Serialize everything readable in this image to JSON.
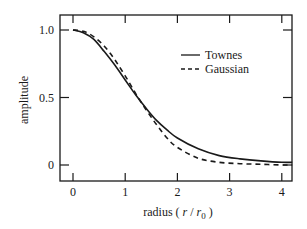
{
  "chart_data": {
    "type": "line",
    "title": "",
    "xlabel": "radius ( r / r0 )",
    "xlabel_parts": {
      "prefix": "radius ( ",
      "r": "r",
      "slash": " / ",
      "r0": "r",
      "sub": "0",
      "suffix": " )"
    },
    "ylabel": "amplitude",
    "xlim": [
      -0.3,
      4.2
    ],
    "ylim": [
      -0.08,
      1.08
    ],
    "x_ticks": [
      0,
      1,
      2,
      3,
      4
    ],
    "x_tick_labels": [
      "0",
      "1",
      "2",
      "3",
      "4"
    ],
    "y_ticks": [
      0,
      0.5,
      1.0
    ],
    "y_tick_labels": [
      "0",
      "0.5",
      "1.0"
    ],
    "grid": false,
    "legend_position": "upper right",
    "series": [
      {
        "name": "Townes",
        "style": "solid",
        "x": [
          0,
          0.2,
          0.4,
          0.6,
          0.8,
          1.0,
          1.2,
          1.4,
          1.6,
          1.8,
          2.0,
          2.4,
          2.8,
          3.2,
          3.6,
          4.0,
          4.2
        ],
        "y": [
          1.0,
          0.98,
          0.93,
          0.84,
          0.74,
          0.63,
          0.52,
          0.42,
          0.33,
          0.26,
          0.2,
          0.12,
          0.07,
          0.045,
          0.03,
          0.02,
          0.02
        ]
      },
      {
        "name": "Gaussian",
        "style": "dashed",
        "x": [
          0,
          0.2,
          0.4,
          0.6,
          0.8,
          1.0,
          1.2,
          1.4,
          1.6,
          1.8,
          2.0,
          2.4,
          2.8,
          3.2,
          3.6,
          4.0,
          4.2
        ],
        "y": [
          1.0,
          0.99,
          0.95,
          0.88,
          0.78,
          0.66,
          0.53,
          0.41,
          0.3,
          0.2,
          0.13,
          0.05,
          0.02,
          0.01,
          0.005,
          0.0,
          0.0
        ]
      }
    ]
  },
  "legend": {
    "items": [
      {
        "label": "Townes",
        "style": "solid"
      },
      {
        "label": "Gaussian",
        "style": "dashed"
      }
    ]
  },
  "colors": {
    "line": "#1a1a1a",
    "frame": "#1a1a1a",
    "background": "#ffffff"
  }
}
